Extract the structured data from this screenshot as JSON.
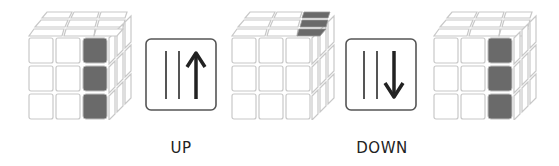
{
  "diagram": {
    "colors": {
      "highlight": "#6a6a6a",
      "sticker": "#ffffff",
      "outline": "#c8c8c8",
      "ink": "#333333"
    },
    "steps": [
      {
        "type": "cube",
        "state": "right column front highlighted",
        "highlight": "front-right-column"
      },
      {
        "type": "move",
        "notation": "up-arrow-right-column",
        "label": "UP"
      },
      {
        "type": "cube",
        "state": "right column moved to top",
        "highlight": "top-right-column"
      },
      {
        "type": "move",
        "notation": "down-arrow-right-column",
        "label": "DOWN"
      },
      {
        "type": "cube",
        "state": "right column front highlighted",
        "highlight": "front-right-column"
      }
    ]
  }
}
